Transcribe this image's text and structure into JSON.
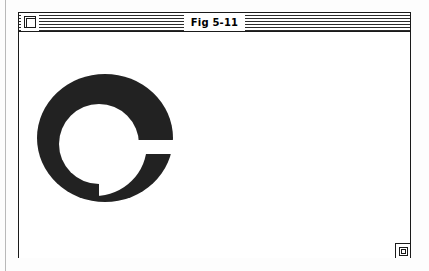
{
  "window": {
    "title": "Fig 5-11",
    "close_box_label": "Close",
    "grow_box_label": "Resize",
    "style": "classic-macintosh",
    "title_bar_pattern": "horizontal-stripes",
    "active": true
  },
  "colors": {
    "ink": "#1a1a1a",
    "paper": "#ffffff",
    "fill": "#222222",
    "page_rule": "#b9b9b9"
  },
  "figure": {
    "caption": "Fig 5-11",
    "shape_name": "spiral-wedge",
    "fill_color": "#222222",
    "bounds": {
      "x": 18,
      "y": 43,
      "width": 136,
      "height": 127
    },
    "outer_ellipse": {
      "cx": 86,
      "cy": 106,
      "rx": 68,
      "ry": 64
    },
    "inner_ellipse": {
      "cx": 80,
      "cy": 112,
      "rx": 40,
      "ry": 40
    },
    "cut_angle_degrees": 0,
    "cut_y": 116
  },
  "page": {
    "margin_rule_x": 5
  }
}
